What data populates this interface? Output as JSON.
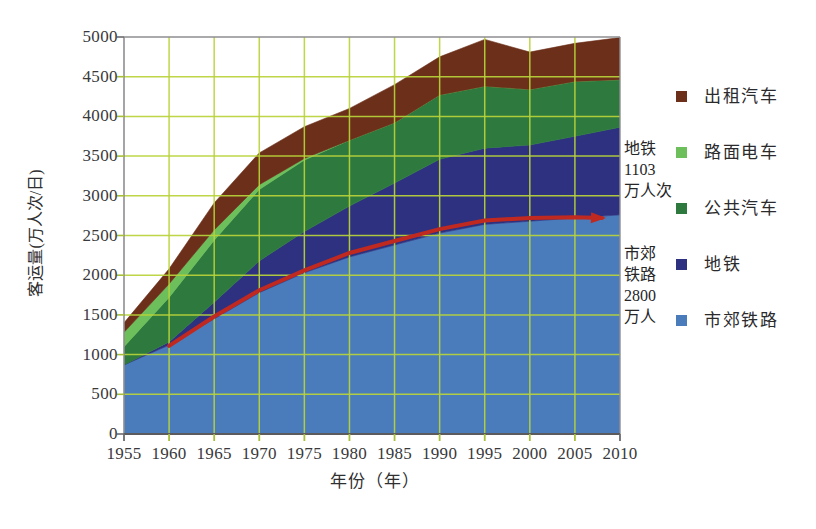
{
  "chart_data": {
    "type": "area",
    "title": "",
    "xlabel": "年份（年）",
    "ylabel": "客运量(万人次/日)",
    "xlim": [
      1955,
      2010
    ],
    "ylim": [
      0,
      5000
    ],
    "grid": true,
    "legend_position": "right",
    "stacked": true,
    "categories": [
      1955,
      1960,
      1965,
      1970,
      1975,
      1980,
      1985,
      1990,
      1995,
      2000,
      2005,
      2010
    ],
    "x_tick_labels": [
      "1955",
      "1960",
      "1965",
      "1970",
      "1975",
      "1980",
      "1985",
      "1990",
      "1995",
      "2000",
      "2005",
      "2010"
    ],
    "y_tick_labels": [
      "5000",
      "4500",
      "4000",
      "3500",
      "3000",
      "2500",
      "2000",
      "1500",
      "1000",
      "500",
      "0"
    ],
    "y_ticks": [
      5000,
      4500,
      4000,
      3500,
      3000,
      2500,
      2000,
      1500,
      1000,
      500,
      0
    ],
    "series": [
      {
        "name": "市郊铁路",
        "color": "#4a7cbb",
        "values": [
          870,
          1120,
          1450,
          1780,
          2030,
          2230,
          2380,
          2530,
          2640,
          2680,
          2720,
          2760
        ]
      },
      {
        "name": "地铁",
        "color": "#2d3180",
        "values": [
          0,
          40,
          210,
          400,
          520,
          640,
          780,
          930,
          960,
          960,
          1030,
          1103
        ]
      },
      {
        "name": "公共汽车",
        "color": "#2e7a3e",
        "values": [
          230,
          560,
          780,
          900,
          900,
          830,
          760,
          810,
          780,
          700,
          690,
          600
        ]
      },
      {
        "name": "路面电车",
        "color": "#6cbf5a",
        "values": [
          180,
          170,
          130,
          60,
          20,
          0,
          0,
          0,
          0,
          0,
          0,
          0
        ]
      },
      {
        "name": "出租汽车",
        "color": "#6b2f1a",
        "values": [
          120,
          190,
          340,
          400,
          400,
          400,
          480,
          480,
          590,
          470,
          480,
          530
        ]
      }
    ],
    "overlay_line": {
      "name": "市郊铁路客运量趋势",
      "color": "#c0291f",
      "arrow": true,
      "x": [
        1960,
        1965,
        1970,
        1975,
        1980,
        1985,
        1990,
        1995,
        2000,
        2005,
        2008
      ],
      "values": [
        1110,
        1480,
        1810,
        2060,
        2280,
        2430,
        2580,
        2690,
        2720,
        2730,
        2720
      ]
    },
    "annotations": [
      {
        "id": "subway",
        "lines": [
          "地铁",
          "1103",
          "万人次"
        ]
      },
      {
        "id": "suburban-rail",
        "lines": [
          "市郊",
          "铁路",
          "2800",
          "万人"
        ]
      }
    ]
  },
  "legend": {
    "items": [
      {
        "label": "出租汽车",
        "color": "#6b2f1a"
      },
      {
        "label": "路面电车",
        "color": "#6cbf5a"
      },
      {
        "label": "公共汽车",
        "color": "#2e7a3e"
      },
      {
        "label": "地铁",
        "color": "#2d3180"
      },
      {
        "label": "市郊铁路",
        "color": "#4a7cbb"
      }
    ]
  },
  "annotations": {
    "subway": "地铁\n1103\n万人次",
    "subway_line1": "地铁",
    "subway_line2": "1103",
    "subway_line3": "万人次",
    "suburban_line1": "市郊",
    "suburban_line2": "铁路",
    "suburban_line3": "2800",
    "suburban_line4": "万人"
  },
  "axes": {
    "y_title": "客运量(万人次/日)",
    "x_title": "年份（年）"
  },
  "colors": {
    "grid": "#b9d43a",
    "frame": "#8e8e90",
    "axis_text": "#39393b",
    "overlay": "#c0291f",
    "background": "#ffffff"
  },
  "caption": {
    "text": ""
  }
}
